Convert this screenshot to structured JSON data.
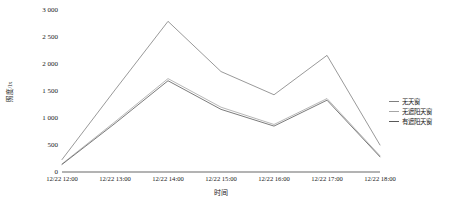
{
  "chart_data": {
    "type": "line",
    "title": "",
    "xlabel": "时间",
    "ylabel": "照度/lx",
    "grid": false,
    "legend_position": "right",
    "x": [
      "12/22 12:00",
      "12/22 13:00",
      "12/22 14:00",
      "12/22 15:00",
      "12/22 16:00",
      "12/22 17:00",
      "12/22 18:00"
    ],
    "categories": [
      "12/22 12:00",
      "12/22 13:00",
      "12/22 14:00",
      "12/22 15:00",
      "12/22 16:00",
      "12/22 17:00",
      "12/22 18:00"
    ],
    "ylim": [
      0,
      3000
    ],
    "yticks": [
      0,
      500,
      1000,
      1500,
      2000,
      2500,
      3000
    ],
    "ytick_labels": [
      "0",
      "500",
      "1 000",
      "1 500",
      "2 000",
      "2 500",
      "3 000"
    ],
    "series": [
      {
        "name": "无天窗",
        "color": "#7f7f7f",
        "values": [
          230,
          1520,
          2790,
          1860,
          1430,
          2160,
          500
        ]
      },
      {
        "name": "无遮阳天窗",
        "color": "#a6a6a6",
        "values": [
          150,
          930,
          1730,
          1200,
          880,
          1360,
          300
        ]
      },
      {
        "name": "有遮阳天窗",
        "color": "#595959",
        "values": [
          140,
          900,
          1690,
          1160,
          850,
          1330,
          280
        ]
      }
    ]
  },
  "legend": {
    "items": [
      {
        "label": "无天窗"
      },
      {
        "label": "无遮阳天窗"
      },
      {
        "label": "有遮阳天窗"
      }
    ]
  },
  "axes": {
    "x_title": "时间",
    "y_title": "照度/lx"
  }
}
